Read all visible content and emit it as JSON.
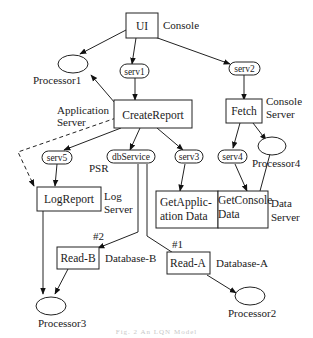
{
  "diagram": {
    "nodes": {
      "ui": "UI",
      "create_report": "CreateReport",
      "fetch": "Fetch",
      "log_report": "LogReport",
      "get_application_data_1": "GetApplic-",
      "get_application_data_2": "ation Data",
      "get_console_data_1": "GetConsole",
      "get_console_data_2": "Data",
      "read_b": "Read-B",
      "read_a": "Read-A"
    },
    "services": {
      "serv1": "serv1",
      "serv2": "serv2",
      "serv3": "serv3",
      "serv4": "serv4",
      "serv5": "serv5",
      "db_service": "dbService"
    },
    "processors": {
      "p1": "Processor1",
      "p2": "Processor2",
      "p3": "Processor3",
      "p4": "Processor4"
    },
    "labels": {
      "console": "Console",
      "application_server_1": "Application",
      "application_server_2": "Server",
      "console_server_1": "Console",
      "console_server_2": "Server",
      "psr": "PSR",
      "log_server_1": "Log",
      "log_server_2": "Server",
      "data_server_1": "Data",
      "data_server_2": "Server",
      "database_b": "Database-B",
      "database_a": "Database-A",
      "hash2": "#2",
      "hash1": "#1"
    },
    "caption": "Fig. 2  An LQN Model"
  }
}
